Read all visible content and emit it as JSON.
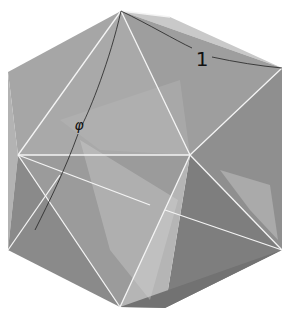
{
  "figure": {
    "labels": {
      "phi": "φ",
      "one": "1"
    },
    "colors": {
      "background": "#ffffff",
      "edge_highlight": "#f2f2f2",
      "arc": "#222222",
      "face_light": "#bdbdbd",
      "face_mid": "#9a9a9a",
      "face_dark": "#7c7c7c"
    }
  }
}
